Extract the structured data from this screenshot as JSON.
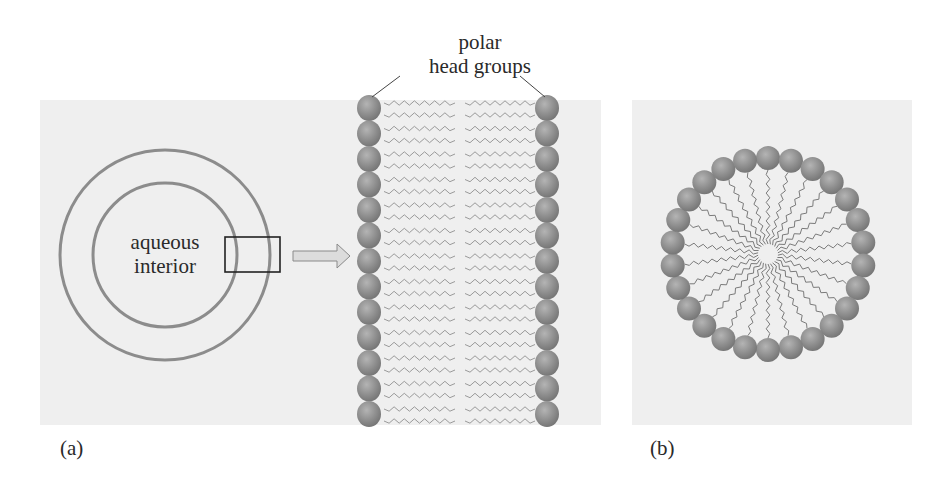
{
  "figure": {
    "panel_a": {
      "label": "(a)",
      "vesicle": {
        "interior_label_line1": "aqueous",
        "interior_label_line2": "interior",
        "center": [
          165,
          255
        ],
        "outer_radius": 105,
        "inner_radius": 72,
        "ring_color": "#8c8c8c",
        "zoom_box": {
          "x": 225,
          "y": 237,
          "w": 55,
          "h": 35
        }
      },
      "arrow": {
        "x1": 293,
        "x2": 350,
        "y": 256,
        "fill": "#dcdcdc",
        "stroke": "#8a8a8a"
      },
      "bilayer": {
        "annotation_line1": "polar",
        "annotation_line2": "head groups",
        "head_count_per_side": 13,
        "left_head_x": 369,
        "right_head_x": 547,
        "first_head_y": 108,
        "head_spacing": 25.5,
        "head_radius": 12,
        "left_tail_x": [
          384,
          455
        ],
        "right_tail_x": [
          465,
          535
        ],
        "tail_color": "#9a9a9a",
        "head_color": "#8f8f8f"
      }
    },
    "panel_b": {
      "label": "(b)",
      "micelle": {
        "center": [
          768,
          254
        ],
        "ring_radius": 96,
        "head_count": 26,
        "head_radius": 12,
        "core_radius": 10,
        "tail_color": "#7a7a7a",
        "head_color": "#8f8f8f"
      }
    },
    "background_color": "#efefef"
  }
}
